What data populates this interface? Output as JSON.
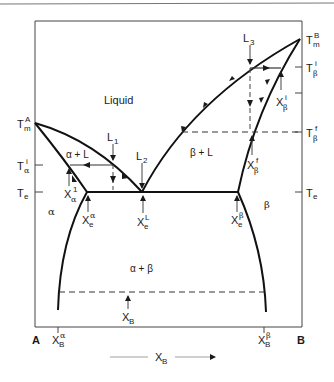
{
  "diagram": {
    "type": "binary eutectic phase diagram",
    "components": {
      "left": "A",
      "right": "B"
    },
    "x_axis": {
      "label": "X",
      "label_sub": "B",
      "direction": "increasing to the right"
    },
    "phase_regions": [
      {
        "id": "liquid",
        "label": "Liquid"
      },
      {
        "id": "alpha_L",
        "label": "α + L"
      },
      {
        "id": "beta_L",
        "label": "β + L"
      },
      {
        "id": "alpha",
        "label": "α"
      },
      {
        "id": "beta",
        "label": "β"
      },
      {
        "id": "alpha_beta",
        "label": "α + β"
      }
    ],
    "left_axis_labels": [
      {
        "id": "Tm_A",
        "main": "T",
        "sub": "m",
        "sup": "A"
      },
      {
        "id": "T_alpha_i",
        "main": "T",
        "sub": "α",
        "sup": "i"
      },
      {
        "id": "Te_left",
        "main": "T",
        "sub": "e",
        "sup": ""
      }
    ],
    "right_axis_labels": [
      {
        "id": "Tm_B",
        "main": "T",
        "sub": "m",
        "sup": "B"
      },
      {
        "id": "T_beta_i",
        "main": "T",
        "sub": "β",
        "sup": "i"
      },
      {
        "id": "T_beta_f",
        "main": "T",
        "sub": "β",
        "sup": "f"
      },
      {
        "id": "Te_right",
        "main": "T",
        "sub": "e",
        "sup": ""
      }
    ],
    "bottom_axis_labels": [
      {
        "id": "A",
        "text": "A"
      },
      {
        "id": "XB_alpha",
        "main": "X",
        "sub": "B",
        "sup": "α"
      },
      {
        "id": "XB_beta",
        "main": "X",
        "sub": "B",
        "sup": "β"
      },
      {
        "id": "B",
        "text": "B"
      }
    ],
    "cooling_paths": [
      {
        "id": "L1",
        "main": "L",
        "sub": "1"
      },
      {
        "id": "L2",
        "main": "L",
        "sub": "2"
      },
      {
        "id": "L3",
        "main": "L",
        "sub": "3"
      }
    ],
    "composition_markers": [
      {
        "id": "X_alpha_1",
        "main": "X",
        "sub": "α",
        "sup": "1"
      },
      {
        "id": "Xe_alpha",
        "main": "X",
        "sub": "e",
        "sup": "α"
      },
      {
        "id": "Xe_L",
        "main": "X",
        "sub": "e",
        "sup": "L"
      },
      {
        "id": "Xe_beta",
        "main": "X",
        "sub": "e",
        "sup": "β"
      },
      {
        "id": "X_beta_i",
        "main": "X",
        "sub": "β",
        "sup": "i"
      },
      {
        "id": "X_beta_f",
        "main": "X",
        "sub": "β",
        "sup": "f"
      },
      {
        "id": "XB",
        "main": "X",
        "sub": "B",
        "sup": ""
      }
    ]
  }
}
